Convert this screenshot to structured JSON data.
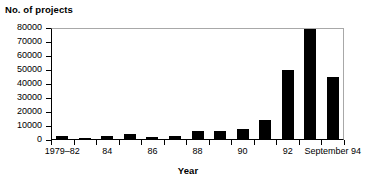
{
  "chart_data": {
    "type": "bar",
    "title": "",
    "xlabel": "Year",
    "ylabel": "No. of projects",
    "ylim": [
      0,
      80000
    ],
    "ytick_labels": [
      "80000",
      "70000",
      "60000",
      "50000",
      "40000",
      "30000",
      "20000",
      "10000",
      "0"
    ],
    "ytick_values": [
      80000,
      70000,
      60000,
      50000,
      40000,
      30000,
      20000,
      10000,
      0
    ],
    "grid": false,
    "legend": null,
    "categories": [
      "1979-82",
      "83",
      "84",
      "85",
      "86",
      "87",
      "88",
      "89",
      "90",
      "91",
      "92",
      "93",
      "September 94"
    ],
    "values": [
      2200,
      600,
      2000,
      3400,
      1100,
      2200,
      5600,
      5800,
      7200,
      13500,
      49500,
      78500,
      44000
    ],
    "xtick_labels": [
      {
        "text": "1979–82",
        "category_index": 0
      },
      {
        "text": "84",
        "category_index": 2
      },
      {
        "text": "86",
        "category_index": 4
      },
      {
        "text": "88",
        "category_index": 6
      },
      {
        "text": "90",
        "category_index": 8
      },
      {
        "text": "92",
        "category_index": 10
      },
      {
        "text": "September 94",
        "category_index": 12
      }
    ],
    "bar_color": "#000000",
    "axis_color": "#000000",
    "frame_color": "#a8a8a8",
    "background": "#ffffff"
  }
}
